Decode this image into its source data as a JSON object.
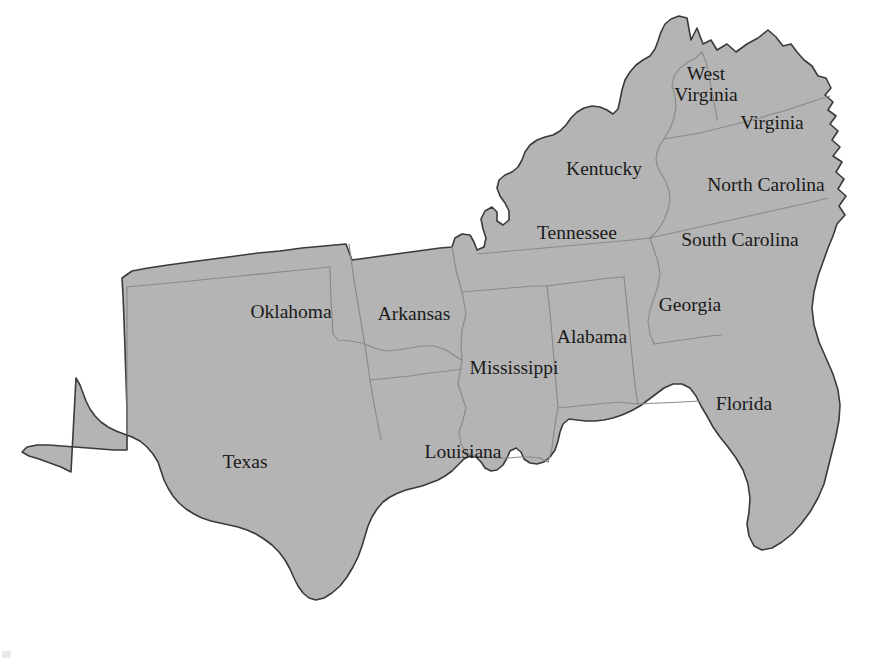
{
  "map": {
    "title": "Southern United States",
    "region_fill_color": "#b4b4b4",
    "outer_border_color": "#3a3a3a",
    "internal_border_color": "#8a8a8a",
    "background_color": "#ffffff",
    "label_color": "#1a1a1a",
    "projection_note": "",
    "states": [
      {
        "id": "texas",
        "name": "Texas",
        "label_x": 245,
        "label_y": 468,
        "lines": [
          "Texas"
        ]
      },
      {
        "id": "oklahoma",
        "name": "Oklahoma",
        "label_x": 291,
        "label_y": 318,
        "lines": [
          "Oklahoma"
        ]
      },
      {
        "id": "arkansas",
        "name": "Arkansas",
        "label_x": 414,
        "label_y": 320,
        "lines": [
          "Arkansas"
        ]
      },
      {
        "id": "louisiana",
        "name": "Louisiana",
        "label_x": 463,
        "label_y": 458,
        "lines": [
          "Louisiana"
        ]
      },
      {
        "id": "mississippi",
        "name": "Mississippi",
        "label_x": 514,
        "label_y": 374,
        "lines": [
          "Mississippi"
        ]
      },
      {
        "id": "alabama",
        "name": "Alabama",
        "label_x": 592,
        "label_y": 343,
        "lines": [
          "Alabama"
        ]
      },
      {
        "id": "tennessee",
        "name": "Tennessee",
        "label_x": 577,
        "label_y": 239,
        "lines": [
          "Tennessee"
        ]
      },
      {
        "id": "kentucky",
        "name": "Kentucky",
        "label_x": 604,
        "label_y": 175,
        "lines": [
          "Kentucky"
        ]
      },
      {
        "id": "west-virginia",
        "name": "West Virginia",
        "label_x": 706,
        "label_y": 80,
        "lines": [
          "West",
          "Virginia"
        ]
      },
      {
        "id": "virginia",
        "name": "Virginia",
        "label_x": 772,
        "label_y": 129,
        "lines": [
          "Virginia"
        ]
      },
      {
        "id": "north-carolina",
        "name": "North Carolina",
        "label_x": 766,
        "label_y": 191,
        "lines": [
          "North Carolina"
        ]
      },
      {
        "id": "south-carolina",
        "name": "South Carolina",
        "label_x": 740,
        "label_y": 246,
        "lines": [
          "South Carolina"
        ]
      },
      {
        "id": "georgia",
        "name": "Georgia",
        "label_x": 690,
        "label_y": 311,
        "lines": [
          "Georgia"
        ]
      },
      {
        "id": "florida",
        "name": "Florida",
        "label_x": 744,
        "label_y": 410,
        "lines": [
          "Florida"
        ]
      }
    ]
  },
  "geometry": {
    "outline": "M 687 18 L 691 40 L 697 28 L 703 44 L 711 40 L 717 50 L 727 44 L 736 52 L 747 44 L 758 38 L 768 30 L 776 37 L 783 46 L 791 44 L 797 52 L 804 60 L 812 66 L 818 76 L 826 78 L 831 88 L 825 95 L 833 102 L 828 110 L 836 116 L 830 124 L 838 131 L 832 140 L 840 147 L 833 156 L 842 162 L 836 172 L 844 179 L 838 189 L 846 196 L 839 206 L 845 215 L 837 224 L 833 236 L 828 248 L 823 262 L 818 276 L 814 292 L 812 308 L 814 325 L 819 342 L 826 358 L 833 374 L 838 390 L 840 405 L 839 420 L 836 436 L 832 452 L 828 468 L 824 484 L 818 498 L 810 512 L 801 524 L 792 534 L 782 542 L 772 548 L 762 550 L 754 546 L 749 536 L 747 524 L 749 512 L 750 498 L 748 484 L 743 470 L 736 458 L 728 447 L 720 437 L 713 427 L 707 416 L 701 406 L 696 396 L 690 388 L 682 384 L 673 384 L 664 388 L 656 394 L 648 400 L 640 406 L 631 411 L 622 415 L 613 418 L 604 420 L 595 421 L 586 421 L 577 420 L 569 419 L 563 424 L 560 432 L 558 441 L 555 450 L 550 457 L 544 462 L 537 464 L 530 463 L 524 459 L 521 452 L 516 448 L 510 451 L 507 458 L 503 465 L 497 470 L 491 471 L 485 468 L 481 462 L 476 457 L 470 456 L 464 459 L 458 465 L 452 471 L 445 476 L 438 480 L 430 483 L 422 486 L 414 488 L 406 490 L 398 493 L 390 497 L 383 502 L 377 509 L 372 517 L 368 526 L 365 536 L 362 546 L 358 557 L 353 567 L 347 577 L 340 586 L 332 593 L 324 598 L 316 600 L 309 598 L 303 593 L 298 586 L 294 578 L 290 569 L 285 560 L 279 552 L 272 545 L 264 539 L 256 534 L 247 530 L 238 527 L 229 525 L 220 523 L 211 521 L 202 518 L 194 514 L 186 509 L 179 503 L 173 496 L 168 488 L 164 480 L 161 471 L 158 462 L 153 454 L 147 447 L 140 441 L 132 437 L 124 434 L 116 431 L 108 427 L 101 422 L 95 416 L 90 409 L 86 401 L 83 393 L 80 385 L 76 378 L 71 472 L 61 467 L 50 463 L 39 459 L 29 456 L 22 452 L 27 447 L 37 445 L 49 445 L 62 446 L 75 447 L 88 448 L 101 449 L 114 450 L 127 450 L 127 434 L 127 410 L 126 380 L 125 350 L 124 320 L 123 295 L 122 278 L 132 271 L 148 268 L 168 265 L 190 262 L 213 259 L 236 256 L 258 253 L 280 251 L 302 248 L 324 246 L 346 244 L 352 260 L 374 257 L 396 254 L 418 251 L 440 248 L 452 247 L 455 238 L 462 234 L 470 235 L 474 242 L 477 250 L 484 247 L 486 238 L 483 229 L 481 219 L 485 211 L 492 207 L 497 212 L 497 221 L 503 225 L 509 220 L 509 211 L 505 203 L 500 196 L 497 188 L 499 180 L 505 175 L 512 172 L 518 167 L 522 160 L 525 152 L 530 145 L 537 140 L 545 137 L 553 135 L 560 131 L 566 125 L 571 118 L 577 112 L 584 108 L 592 106 L 600 107 L 607 110 L 613 114 L 618 109 L 620 100 L 622 90 L 625 80 L 630 72 L 636 65 L 643 60 L 650 56 L 655 49 L 658 41 L 661 32 L 665 24 L 671 19 L 679 16 Z",
    "internal": [
      "M 127 287 L 127 434",
      "M 127 287 L 180 282 L 240 276 L 300 270 L 330 267",
      "M 330 267 L 331 300 L 333 334 L 338 340 L 350 341 L 362 343 L 374 348 L 386 351 L 398 350 L 410 348 L 422 346 L 434 346 L 446 350 L 455 356 L 462 360",
      "M 349 244 L 354 280 L 360 316 L 366 352 L 370 380 L 374 404 L 378 424 L 381 440",
      "M 370 380 L 390 378 L 410 376 L 430 373 L 448 371 L 462 369",
      "M 462 360 L 460 372 L 458 384 L 462 396 L 466 408 L 463 420 L 459 432 L 461 444 L 466 452 L 474 456 L 484 457",
      "M 452 247 L 456 270 L 462 292 L 466 314 L 462 330 L 461 346 L 462 360",
      "M 484 457 L 496 458 L 508 458 L 520 457 L 530 457 L 540 458 L 548 462",
      "M 548 462 L 552 448 L 554 432 L 556 418 L 558 408",
      "M 558 408 L 556 384 L 554 360 L 552 336 L 550 312 L 548 296 L 547 286",
      "M 462 292 L 486 290 L 510 288 L 534 286 L 547 286",
      "M 547 286 L 562 284 L 578 282 L 594 280 L 610 278 L 624 277",
      "M 624 277 L 626 296 L 628 316 L 630 336 L 632 356 L 634 376 L 636 392 L 638 404",
      "M 558 408 L 578 406 L 598 404 L 618 402 L 638 404",
      "M 638 404 L 660 403 L 682 402 L 700 401",
      "M 478 254 L 500 252 L 522 250 L 544 248 L 566 246 L 588 244 L 610 242 L 632 240 L 650 238",
      "M 650 238 L 654 250 L 658 262 L 660 274 L 658 286 L 654 298 L 650 310 L 648 322 L 650 334 L 654 344",
      "M 650 238 L 668 234 L 686 230 L 704 226 L 722 222 L 740 218 L 758 214 L 776 210 L 794 206 L 812 202 L 828 198",
      "M 654 344 L 668 342 L 682 340 L 696 338 L 710 336 L 722 335",
      "M 650 238 L 658 230 L 664 220 L 668 210 L 670 200 L 669 190 L 666 182 L 662 175 L 658 168 L 656 160 L 657 152 L 660 145 L 664 139",
      "M 664 139 L 676 137 L 688 135 L 700 133 L 712 130 L 724 127 L 736 124 L 748 121 L 760 118 L 772 114 L 784 111 L 796 107 L 808 103 L 820 99 L 830 96",
      "M 664 139 L 670 129 L 674 118 L 676 107 L 675 96 L 672 86 L 674 76 L 680 68 L 688 62 L 696 58 L 702 52",
      "M 702 52 L 706 62 L 708 72 L 710 82 L 712 92 L 714 102 L 716 112 L 717 120"
    ]
  },
  "artifact": {
    "present": true,
    "description": "faint-mark-bottom-left"
  }
}
